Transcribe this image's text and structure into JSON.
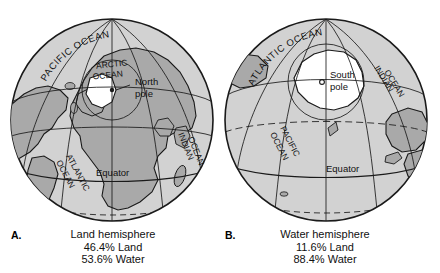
{
  "figure": {
    "colors": {
      "ocean": "#d2d2d2",
      "land": "#a9a9a9",
      "ice": "#ffffff",
      "outline": "#1a1a1a",
      "text": "#111111",
      "background": "#ffffff"
    }
  },
  "panels": [
    {
      "letter": "A.",
      "caption": {
        "title": "Land hemisphere",
        "land_pct": "46.4% Land",
        "water_pct": "53.6% Water"
      },
      "pole": {
        "name_line1": "North",
        "name_line2": "pole"
      },
      "equator_label": "Equator",
      "ocean_labels": [
        {
          "id": "pacific",
          "text": "PACIFIC OCEAN"
        },
        {
          "id": "arctic-line1",
          "text": "ARCTIC"
        },
        {
          "id": "arctic-line2",
          "text": "OCEAN"
        },
        {
          "id": "atlantic-line1",
          "text": "ATLANTIC"
        },
        {
          "id": "atlantic-line2",
          "text": "OCEAN"
        },
        {
          "id": "indian-line1",
          "text": "INDIAN"
        },
        {
          "id": "indian-line2",
          "text": "OCEAN"
        }
      ]
    },
    {
      "letter": "B.",
      "caption": {
        "title": "Water hemisphere",
        "land_pct": "11.6% Land",
        "water_pct": "88.4% Water"
      },
      "pole": {
        "name_line1": "South",
        "name_line2": "pole"
      },
      "equator_label": "Equator",
      "ocean_labels": [
        {
          "id": "atlantic",
          "text": "ATLANTIC OCEAN"
        },
        {
          "id": "indian-line1",
          "text": "INDIAN"
        },
        {
          "id": "indian-line2",
          "text": "OCEAN"
        },
        {
          "id": "pacific-line1",
          "text": "PACIFIC"
        },
        {
          "id": "pacific-line2",
          "text": "OCEAN"
        }
      ]
    }
  ]
}
